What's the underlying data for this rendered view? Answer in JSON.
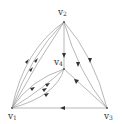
{
  "diagram": {
    "type": "directed multigraph",
    "vertices": [
      {
        "id": "v1",
        "label": "v",
        "sub": "1",
        "x": 12,
        "y": 108
      },
      {
        "id": "v2",
        "label": "v",
        "sub": "2",
        "x": 64,
        "y": 22
      },
      {
        "id": "v3",
        "label": "v",
        "sub": "3",
        "x": 107,
        "y": 108
      },
      {
        "id": "v4",
        "label": "v",
        "sub": "4",
        "x": 64,
        "y": 69
      }
    ],
    "edges": [
      {
        "from": "v2",
        "to": "v1",
        "count": 3,
        "style": "curved-left"
      },
      {
        "from": "v2",
        "to": "v4",
        "count": 1,
        "style": "straight"
      },
      {
        "from": "v2",
        "to": "v3",
        "count": 2,
        "style": "curved-right"
      },
      {
        "from": "v4",
        "to": "v1",
        "count": 3,
        "style": "curved"
      },
      {
        "from": "v3",
        "to": "v4",
        "count": 1,
        "style": "straight"
      },
      {
        "from": "v3",
        "to": "v1",
        "count": 1,
        "style": "straight"
      }
    ],
    "colors": {
      "edge": "#9a9a9a",
      "arrow": "#333333",
      "text": "#333333"
    }
  }
}
